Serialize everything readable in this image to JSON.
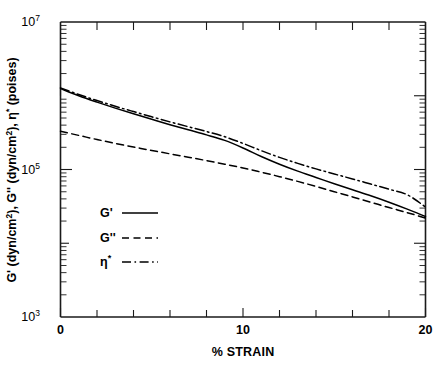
{
  "chart_data": {
    "type": "line",
    "title": "",
    "xlabel": "% STRAIN",
    "ylabel": "G' (dyn/cm2), G'' (dyn/cm2), η* (poises)",
    "xlim": [
      0,
      20
    ],
    "ylim": [
      1000,
      10000000
    ],
    "yscale": "log",
    "grid": false,
    "legend_position": "center-left",
    "xticks": [
      0,
      10,
      20
    ],
    "xtick_labels": [
      "0",
      "10",
      "20"
    ],
    "xminor_step": 2,
    "yticks": [
      1000,
      100000,
      10000000
    ],
    "ytick_labels": [
      "10³",
      "10⁵",
      "10⁷"
    ],
    "series": [
      {
        "name": "G'",
        "style": "solid",
        "x": [
          0,
          1,
          2,
          3,
          4,
          5,
          6,
          7,
          8,
          9,
          10,
          11,
          12,
          13,
          14,
          15,
          16,
          17,
          18,
          19,
          20
        ],
        "y": [
          1250000,
          1000000,
          820000,
          680000,
          570000,
          480000,
          405000,
          345000,
          295000,
          248000,
          196000,
          150000,
          118000,
          95000,
          78000,
          64000,
          53000,
          44000,
          36000,
          29000,
          23000
        ]
      },
      {
        "name": "G''",
        "style": "dashed",
        "x": [
          0,
          1,
          2,
          3,
          4,
          5,
          6,
          7,
          8,
          9,
          10,
          11,
          12,
          13,
          14,
          15,
          16,
          17,
          18,
          19,
          20
        ],
        "y": [
          330000,
          290000,
          255000,
          226000,
          202000,
          181000,
          163000,
          147000,
          132000,
          118000,
          105000,
          92000,
          80000,
          69000,
          59000,
          50000,
          42500,
          36000,
          30500,
          26000,
          22000
        ]
      },
      {
        "name": "η*",
        "style": "dashdot",
        "x": [
          0,
          1,
          2,
          3,
          4,
          5,
          6,
          7,
          8,
          9,
          10,
          11,
          12,
          13,
          14,
          15,
          16,
          17,
          18,
          19,
          20
        ],
        "y": [
          1280000,
          1040000,
          860000,
          720000,
          610000,
          518000,
          442000,
          380000,
          327000,
          278000,
          226000,
          180000,
          146000,
          121000,
          102000,
          87000,
          74500,
          63500,
          54000,
          45500,
          31000
        ]
      }
    ]
  },
  "axes": {
    "x_title": "% STRAIN",
    "x_tick_0": "0",
    "x_tick_10": "10",
    "x_tick_20": "20",
    "y_top_mantissa": "10",
    "y_top_exponent": "7",
    "y_mid_mantissa": "10",
    "y_mid_exponent": "5",
    "y_bottom_mantissa": "10",
    "y_bottom_exponent": "3",
    "y_title_parts": {
      "p1": "G' (dyn/cm",
      "p1_sup": "2",
      "p2": "), G'' (dyn/cm",
      "p2_sup": "2",
      "p3": "), η",
      "p3_sup": "*",
      "p4": " (poises)"
    }
  },
  "legend": {
    "items": [
      {
        "label": "G'",
        "sup": "",
        "style": "solid",
        "name": "legend-item-g-prime"
      },
      {
        "label": "G''",
        "sup": "",
        "style": "dashed",
        "name": "legend-item-g-double-prime"
      },
      {
        "label": "η",
        "sup": "*",
        "style": "dashdot",
        "name": "legend-item-eta-star"
      }
    ]
  }
}
